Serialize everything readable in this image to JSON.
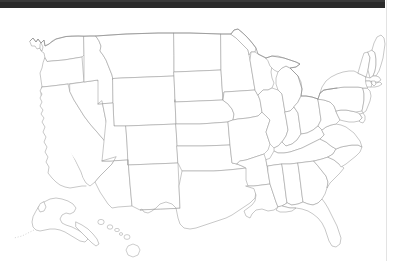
{
  "window": {
    "titlebar_label": "",
    "titlebar_color": "#2b2b2b",
    "background_color": "#ffffff"
  },
  "map": {
    "title": "",
    "kind": "blank-outline-map",
    "region": "United States of America",
    "projection_note": "Alaska and Hawaii shown as insets at lower left",
    "labels_shown": "none",
    "fill_color": "#ffffff",
    "border_color": "#9a9a9a",
    "outer_border_color": "#8d8d8d",
    "state_count": 50,
    "insets": [
      {
        "name": "Alaska",
        "position": "lower-left"
      },
      {
        "name": "Hawaii",
        "position": "lower-center-left"
      }
    ],
    "states": [
      "Washington",
      "Oregon",
      "California",
      "Nevada",
      "Idaho",
      "Montana",
      "Wyoming",
      "Utah",
      "Arizona",
      "Colorado",
      "New Mexico",
      "North Dakota",
      "South Dakota",
      "Nebraska",
      "Kansas",
      "Oklahoma",
      "Texas",
      "Minnesota",
      "Iowa",
      "Missouri",
      "Arkansas",
      "Louisiana",
      "Wisconsin",
      "Illinois",
      "Michigan",
      "Indiana",
      "Ohio",
      "Kentucky",
      "Tennessee",
      "Mississippi",
      "Alabama",
      "Georgia",
      "Florida",
      "South Carolina",
      "North Carolina",
      "Virginia",
      "West Virginia",
      "Maryland",
      "Delaware",
      "Pennsylvania",
      "New Jersey",
      "New York",
      "Connecticut",
      "Rhode Island",
      "Massachusetts",
      "Vermont",
      "New Hampshire",
      "Maine",
      "Alaska",
      "Hawaii"
    ]
  }
}
